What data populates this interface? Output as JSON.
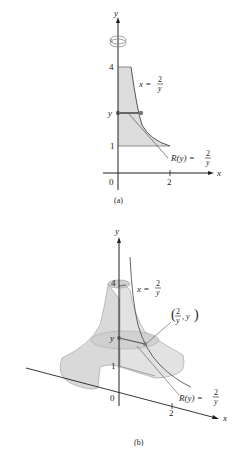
{
  "figure_a": {
    "caption": "(a)",
    "axis_y_label": "y",
    "axis_x_label": "x",
    "origin_label": "0",
    "tick_y_4": "4",
    "tick_y_1": "1",
    "tick_y_var": "y",
    "tick_x_2": "2",
    "curve_label_lhs": "x =",
    "curve_label_num": "2",
    "curve_label_den": "y",
    "radius_label_lhs": "R(y) =",
    "radius_label_num": "2",
    "radius_label_den": "y",
    "rotation_icon": "rotation-arrow-icon",
    "colors": {
      "region_fill": "#dcdcdc",
      "curve": "#555555",
      "axis": "#231f20",
      "point": "#666666"
    }
  },
  "figure_b": {
    "caption": "(b)",
    "axis_y_label": "y",
    "axis_x_label": "x",
    "origin_label": "0",
    "tick_y_4": "4",
    "tick_y_1": "1",
    "tick_y_var": "y",
    "tick_x_2": "2",
    "curve_label_lhs": "x =",
    "curve_label_num": "2",
    "curve_label_den": "y",
    "point_label_num": "2",
    "point_label_den": "y",
    "point_label_y": ", y",
    "radius_label_lhs": "R(y) =",
    "radius_label_num": "2",
    "radius_label_den": "y",
    "colors": {
      "solid_fill": "#d9d9d9",
      "solid_edge": "#9a9a9a",
      "curve": "#555555",
      "axis": "#231f20"
    }
  }
}
